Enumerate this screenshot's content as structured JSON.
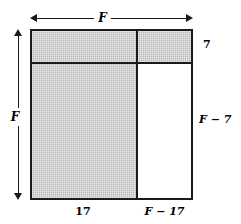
{
  "figure": {
    "type": "geometry-diagram",
    "colors": {
      "shaded_fill": "#b9b9b9",
      "unshaded_fill": "#ffffff",
      "stroke": "#1a1a1a",
      "background": "#ffffff"
    },
    "dimensions": {
      "top_width": {
        "label": "F",
        "position": "top",
        "arrow": "double-headed"
      },
      "left_height": {
        "label": "F",
        "position": "left",
        "arrow": "double-headed"
      },
      "right_top_segment": {
        "label": "7",
        "position": "right-upper"
      },
      "right_bottom_segment": {
        "label": "F − 7",
        "position": "right-lower"
      },
      "bottom_left_segment": {
        "label": "17",
        "position": "bottom-left"
      },
      "bottom_right_segment": {
        "label": "F − 17",
        "position": "bottom-right"
      }
    },
    "regions": [
      {
        "name": "top-band",
        "fill": "shaded",
        "width_label": "F",
        "height_label": "7"
      },
      {
        "name": "bottom-left",
        "fill": "shaded",
        "width_label": "17",
        "height_label": "F − 7"
      },
      {
        "name": "bottom-right",
        "fill": "unshaded",
        "width_label": "F − 17",
        "height_label": "F − 7"
      }
    ]
  }
}
